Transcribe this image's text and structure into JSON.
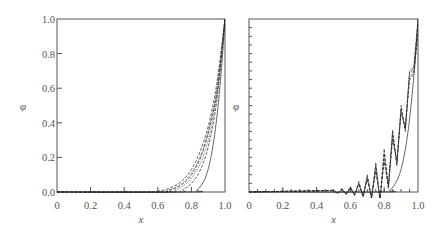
{
  "chart_data": [
    {
      "type": "line",
      "panel": "left",
      "title": "",
      "xlabel": "x",
      "ylabel": "φ",
      "xlim": [
        0,
        1.0
      ],
      "ylim": [
        0,
        1.0
      ],
      "x_ticks": [
        "0",
        "0.2",
        "0.4",
        "0.6",
        "0.8",
        "1.0"
      ],
      "y_ticks": [
        "0.0",
        "0.2",
        "0.4",
        "0.6",
        "0.8",
        "1.0"
      ],
      "grid": false,
      "legend": null,
      "description": "Family of smooth monotone boundary-layer profiles; mix of solid, dashed and dotted lines; steepest solid curve rises from ~0.83 to 1.0 at x=1",
      "series": [
        {
          "name": "profile-1 (widest)",
          "style": "dashed",
          "x": [
            0.55,
            0.6,
            0.65,
            0.7,
            0.75,
            0.8,
            0.85,
            0.9,
            0.95,
            1.0
          ],
          "values": [
            0.0,
            0.005,
            0.015,
            0.035,
            0.07,
            0.13,
            0.23,
            0.38,
            0.62,
            1.0
          ]
        },
        {
          "name": "profile-2",
          "style": "dotted",
          "x": [
            0.6,
            0.65,
            0.7,
            0.75,
            0.8,
            0.85,
            0.9,
            0.95,
            1.0
          ],
          "values": [
            0.0,
            0.008,
            0.025,
            0.055,
            0.11,
            0.2,
            0.35,
            0.59,
            1.0
          ]
        },
        {
          "name": "profile-3",
          "style": "dashed",
          "x": [
            0.62,
            0.67,
            0.72,
            0.77,
            0.82,
            0.87,
            0.92,
            0.96,
            1.0
          ],
          "values": [
            0.0,
            0.01,
            0.03,
            0.065,
            0.13,
            0.24,
            0.42,
            0.63,
            1.0
          ]
        },
        {
          "name": "profile-4",
          "style": "dotted",
          "x": [
            0.65,
            0.7,
            0.75,
            0.8,
            0.85,
            0.9,
            0.95,
            1.0
          ],
          "values": [
            0.0,
            0.012,
            0.035,
            0.08,
            0.16,
            0.3,
            0.55,
            1.0
          ]
        },
        {
          "name": "profile-5",
          "style": "dashed",
          "x": [
            0.7,
            0.75,
            0.8,
            0.85,
            0.9,
            0.95,
            1.0
          ],
          "values": [
            0.0,
            0.015,
            0.05,
            0.12,
            0.26,
            0.52,
            1.0
          ]
        },
        {
          "name": "profile-6 (steepest)",
          "style": "solid",
          "x": [
            0.8,
            0.83,
            0.86,
            0.89,
            0.92,
            0.95,
            0.98,
            1.0
          ],
          "values": [
            0.0,
            0.01,
            0.04,
            0.1,
            0.22,
            0.42,
            0.72,
            1.0
          ]
        }
      ]
    },
    {
      "type": "line",
      "panel": "right",
      "title": "",
      "xlabel": "x",
      "ylabel": "φ",
      "xlim": [
        0,
        1.0
      ],
      "ylim": [
        0,
        1.0
      ],
      "x_ticks": [
        "0",
        "0.2",
        "0.4",
        "0.6",
        "0.8",
        "1.0"
      ],
      "y_ticks": [],
      "y_minor_tick_step": 0.05,
      "x_minor_tick_step": 0.05,
      "grid": false,
      "legend": null,
      "description": "Oscillatory (wiggly) numerical solutions with spurious peaks at x spacing 0.05 growing toward x=1, plus a smooth solid reference curve",
      "series": [
        {
          "name": "oscillatory-peaks",
          "style": "dashed",
          "x": [
            0.5,
            0.525,
            0.55,
            0.575,
            0.6,
            0.625,
            0.65,
            0.675,
            0.7,
            0.725,
            0.75,
            0.775,
            0.8,
            0.825,
            0.85,
            0.875,
            0.9,
            0.925,
            0.95,
            0.975,
            1.0
          ],
          "values": [
            0.01,
            -0.01,
            0.02,
            -0.015,
            0.03,
            -0.02,
            0.06,
            -0.03,
            0.1,
            -0.04,
            0.17,
            -0.05,
            0.25,
            0.02,
            0.36,
            0.15,
            0.5,
            0.35,
            0.7,
            0.72,
            1.0
          ]
        },
        {
          "name": "smooth-reference",
          "style": "solid",
          "x": [
            0.8,
            0.83,
            0.86,
            0.89,
            0.92,
            0.95,
            0.98,
            1.0
          ],
          "values": [
            0.0,
            0.01,
            0.04,
            0.1,
            0.22,
            0.42,
            0.72,
            1.0
          ]
        }
      ]
    }
  ]
}
